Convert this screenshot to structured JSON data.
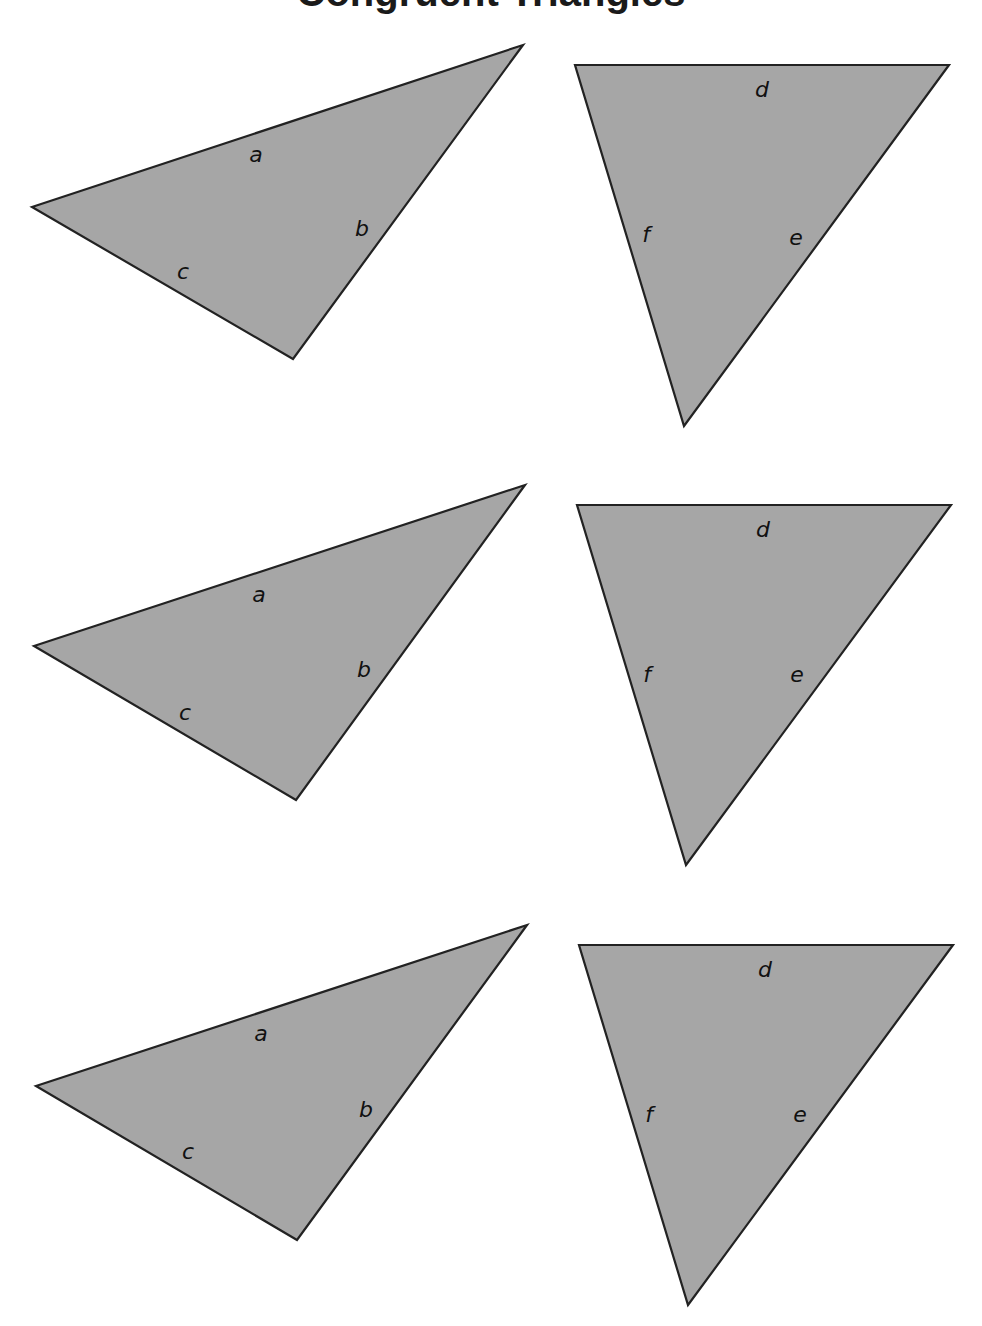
{
  "page": {
    "title": "Congruent Triangles",
    "background": "#ffffff",
    "fill_color": "#a6a6a6",
    "stroke_color": "#222222"
  },
  "rows": [
    {
      "left": {
        "points": "32,207 523,45 293,359",
        "labels": [
          {
            "text": "a",
            "x": 256,
            "y": 162
          },
          {
            "text": "b",
            "x": 362,
            "y": 236
          },
          {
            "text": "c",
            "x": 183,
            "y": 279
          }
        ]
      },
      "right": {
        "points": "575,65 949,65 684,426",
        "labels": [
          {
            "text": "d",
            "x": 762,
            "y": 97
          },
          {
            "text": "f",
            "x": 646,
            "y": 242
          },
          {
            "text": "e",
            "x": 796,
            "y": 245
          }
        ]
      }
    },
    {
      "left": {
        "points": "34,646 525,485 296,800",
        "labels": [
          {
            "text": "a",
            "x": 259,
            "y": 602
          },
          {
            "text": "b",
            "x": 364,
            "y": 677
          },
          {
            "text": "c",
            "x": 185,
            "y": 720
          }
        ]
      },
      "right": {
        "points": "577,505 951,505 686,865",
        "labels": [
          {
            "text": "d",
            "x": 763,
            "y": 537
          },
          {
            "text": "f",
            "x": 647,
            "y": 682
          },
          {
            "text": "e",
            "x": 797,
            "y": 682
          }
        ]
      }
    },
    {
      "left": {
        "points": "36,1086 527,925 297,1240",
        "labels": [
          {
            "text": "a",
            "x": 261,
            "y": 1041
          },
          {
            "text": "b",
            "x": 366,
            "y": 1117
          },
          {
            "text": "c",
            "x": 188,
            "y": 1159
          }
        ]
      },
      "right": {
        "points": "579,945 953,945 688,1305",
        "labels": [
          {
            "text": "d",
            "x": 765,
            "y": 977
          },
          {
            "text": "f",
            "x": 649,
            "y": 1122
          },
          {
            "text": "e",
            "x": 800,
            "y": 1122
          }
        ]
      }
    }
  ]
}
